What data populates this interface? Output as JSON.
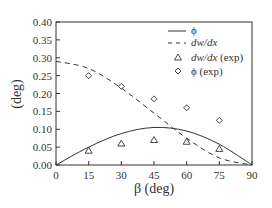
{
  "chart_data": {
    "type": "line",
    "title": "",
    "xlabel": "β (deg)",
    "ylabel": "(deg)",
    "xlim": [
      0,
      90
    ],
    "ylim": [
      0.0,
      0.4
    ],
    "grid": false,
    "legend_position": "upper right",
    "x_ticks": [
      "0",
      "15",
      "30",
      "45",
      "60",
      "75",
      "90"
    ],
    "y_ticks": [
      "0.00",
      "0.05",
      "0.10",
      "0.15",
      "0.20",
      "0.25",
      "0.30",
      "0.35",
      "0.40"
    ],
    "series": [
      {
        "name": "ϕ",
        "style": "solid line",
        "x": [
          0,
          15,
          30,
          45,
          60,
          75,
          90
        ],
        "values": [
          0.0,
          0.05,
          0.088,
          0.105,
          0.095,
          0.058,
          0.0
        ]
      },
      {
        "name": "dw/dx",
        "style": "dashed line",
        "x": [
          0,
          15,
          30,
          45,
          60,
          75,
          90
        ],
        "values": [
          0.29,
          0.27,
          0.215,
          0.145,
          0.075,
          0.02,
          0.0
        ]
      },
      {
        "name": "dw/dx (exp)",
        "style": "triangle markers",
        "x": [
          15,
          30,
          45,
          60,
          75
        ],
        "values": [
          0.04,
          0.06,
          0.07,
          0.065,
          0.045
        ]
      },
      {
        "name": "ϕ (exp)",
        "style": "diamond markers",
        "x": [
          15,
          30,
          45,
          60,
          75
        ],
        "values": [
          0.25,
          0.22,
          0.185,
          0.16,
          0.125
        ]
      }
    ],
    "legend": [
      {
        "label": "ϕ",
        "italic": false
      },
      {
        "label": "dw/dx",
        "italic": true
      },
      {
        "label_italic": "dw/dx",
        "label_rest": " (exp)"
      },
      {
        "label": "ϕ (exp)",
        "italic": false
      }
    ]
  },
  "colors": {
    "line": "#333333",
    "background": "#ffffff"
  }
}
